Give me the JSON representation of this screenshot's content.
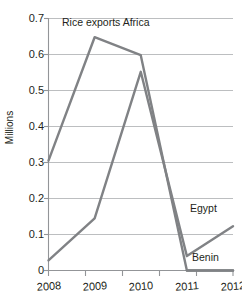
{
  "chart_data": {
    "type": "line",
    "title": "",
    "xlabel": "",
    "ylabel": "Millions",
    "x": [
      "2008",
      "2009",
      "2010",
      "2011",
      "2012"
    ],
    "xticklabels": [
      "2008",
      "2009",
      "2010",
      "2011",
      "2012"
    ],
    "yticklabels": [
      "0",
      "0.1",
      "0.2",
      "0.3",
      "0.4",
      "0.5",
      "0.6",
      "0.7"
    ],
    "ytickvalues": [
      0,
      0.1,
      0.2,
      0.3,
      0.4,
      0.5,
      0.6,
      0.7
    ],
    "ylim": [
      0,
      0.7
    ],
    "grid": "horizontal",
    "legend_position": "inline-annotations",
    "line_color": "#808285",
    "grid_color": "#bcbec0",
    "axis_color": "#939598",
    "text_color": "#231f20",
    "series": [
      {
        "name": "Rice exports Africa",
        "label_text": "Rice exports Africa",
        "values": [
          0.305,
          0.648,
          0.598,
          0.0,
          0.0
        ]
      },
      {
        "name": "Egypt",
        "label_text": "Egypt",
        "values": [
          0.028,
          0.145,
          0.552,
          0.04,
          0.123
        ]
      },
      {
        "name": "Benin",
        "label_text": "Benin",
        "values": [
          null,
          null,
          null,
          0.0,
          0.0
        ]
      }
    ],
    "annotations": [
      {
        "id": "title-africa",
        "text": "Rice exports Africa"
      },
      {
        "id": "label-egypt",
        "text": "Egypt"
      },
      {
        "id": "label-benin",
        "text": "Benin"
      }
    ]
  }
}
